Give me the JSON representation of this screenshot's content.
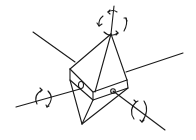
{
  "diagram": {
    "type": "line-drawing",
    "subject": "crystal prism with three rotation axes",
    "stroke_color": "#1a1a1a",
    "background_color": "#ffffff",
    "elements": {
      "axes": [
        {
          "name": "vertical-axis",
          "rotation_arrows": 1
        },
        {
          "name": "left-right-axis",
          "rotation_arrows": 1
        },
        {
          "name": "front-back-axis",
          "rotation_arrows": 1
        }
      ],
      "solid": "prism with pyramidal top and bottom",
      "axis_pivot_marks": 2
    }
  }
}
